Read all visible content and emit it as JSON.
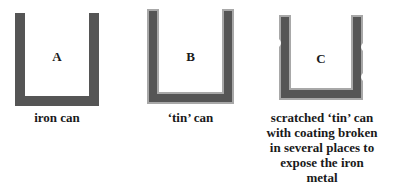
{
  "cans": [
    {
      "id": "A",
      "label": "A",
      "caption": "iron can",
      "type": "iron"
    },
    {
      "id": "B",
      "label": "B",
      "caption": "‘tin’ can",
      "type": "tin"
    },
    {
      "id": "C",
      "label": "C",
      "caption_lines": [
        "scratched ‘tin’ can",
        "with coating broken",
        "in several places to",
        "expose the iron",
        "metal"
      ],
      "type": "scratched-tin"
    }
  ],
  "colors": {
    "iron": "#555555",
    "tin_coating": "#a8a8a8"
  }
}
